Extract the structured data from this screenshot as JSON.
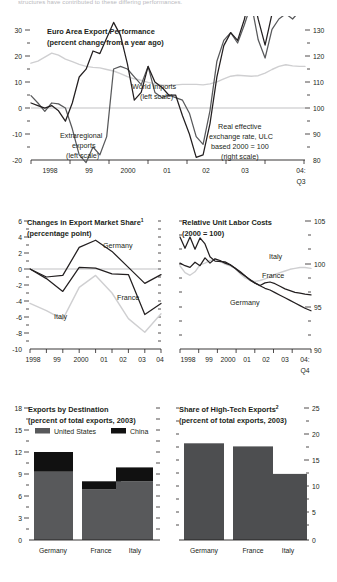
{
  "page": {
    "clipped_text_top": "structures have contributed to these differing performances."
  },
  "charts": [
    {
      "id": "export-performance",
      "type": "line",
      "title": "Euro Area Export Performance",
      "subtitle": "(percent change from a year ago)",
      "ylabel_left": "",
      "ylabel_right": "",
      "ylim_left": [
        -20,
        30
      ],
      "yticks_left": [
        "30",
        "20",
        "10",
        "0",
        "-10",
        "-20"
      ],
      "ylim_right": [
        80,
        130
      ],
      "yticks_right": [
        "130",
        "120",
        "110",
        "100",
        "90",
        "80"
      ],
      "xticks": [
        "1998",
        "99",
        "2000",
        "01",
        "02",
        "03",
        "04:"
      ],
      "xtick_sub": "Q3",
      "annotations": [
        {
          "label": "World imports",
          "label2": "(left scale)"
        },
        {
          "label": "Extraregional",
          "label2": "exports",
          "label3": "(left scale)"
        },
        {
          "label": "Real effective",
          "label2": "exchange rate, ULC",
          "label3": "based 2000 = 100",
          "label4": "(right scale)"
        }
      ],
      "series": [
        {
          "name": "World imports",
          "axis": "left",
          "color": "#231f20",
          "values": [
            2,
            1.5,
            1,
            1.5,
            -0.5,
            -2.5,
            1,
            6,
            7.5,
            11,
            10.5,
            13.5,
            16.5,
            14,
            8.5,
            1.5,
            3,
            8,
            5,
            4,
            2.5,
            2.5,
            -1.5,
            -5,
            -9.5,
            -9,
            -3,
            6,
            12,
            14.5,
            13,
            17,
            23,
            17,
            12,
            18,
            20,
            21.5,
            20.5,
            21.5,
            23.5
          ]
        },
        {
          "name": "Extraregional exports",
          "axis": "left",
          "color": "#58595b",
          "values": [
            5,
            1,
            -3.5,
            1,
            0.5,
            0,
            -4,
            -9,
            -10.5,
            -7,
            -9,
            -5.5,
            7.5,
            8,
            7.5,
            6,
            4.5,
            8,
            3,
            2,
            2.5,
            2,
            1.5,
            -1,
            -5.5,
            -7,
            -0.5,
            9,
            13,
            14.5,
            12.5,
            16,
            22,
            15,
            11.5,
            17,
            19,
            20,
            19,
            20.5,
            22
          ]
        },
        {
          "name": "Real effective exchange rate, ULC",
          "axis": "right",
          "color": "#cfcfd1",
          "values": [
            118,
            120,
            124,
            128,
            126,
            122,
            119.5,
            117,
            115,
            114,
            113.5,
            112,
            110.5,
            108,
            105,
            103,
            101.5,
            99.5,
            98,
            97,
            96.5,
            97,
            97.5,
            97.5,
            97.5,
            97,
            98,
            100,
            103,
            105.5,
            106.5,
            106,
            105.5,
            106,
            108.5,
            112,
            115,
            116.5,
            115.5,
            115,
            115
          ]
        }
      ]
    },
    {
      "id": "export-market-share",
      "type": "line",
      "title": "Changes in Export Market Share",
      "title_superscript": "1",
      "subtitle": "(percentage point)",
      "ylim": [
        -10,
        6
      ],
      "yticks": [
        "6",
        "4",
        "2",
        "0",
        "-2",
        "-4",
        "-6",
        "-8",
        "-10"
      ],
      "xticks": [
        "1998",
        "99",
        "2000",
        "01",
        "02",
        "03",
        "04"
      ],
      "series": [
        {
          "name": "Germany",
          "color": "#231f20",
          "values": [
            0,
            -1,
            -0.8,
            2.7,
            3.6,
            2.2,
            0.2,
            -1.8,
            -0.7
          ]
        },
        {
          "name": "France",
          "color": "#333333",
          "values": [
            0,
            -1.2,
            -2.8,
            0.2,
            0.1,
            -0.6,
            -0.7,
            -5.7,
            -4.3
          ]
        },
        {
          "name": "Italy",
          "color": "#cfcfd1",
          "values": [
            -4.3,
            -5.2,
            -6.3,
            -2.3,
            -0.8,
            -3.0,
            -6.2,
            -7.9,
            -5.6
          ]
        }
      ]
    },
    {
      "id": "relative-unit-labor-costs",
      "type": "line",
      "title": "Relative Unit Labor Costs",
      "subtitle": "(2000 = 100)",
      "ylim": [
        90,
        105
      ],
      "yticks": [
        "105",
        "100",
        "95",
        "90"
      ],
      "xticks": [
        "1998",
        "99",
        "2000",
        "01",
        "02",
        "03",
        "04:"
      ],
      "xtick_sub": "Q4",
      "series": [
        {
          "name": "Germany",
          "color": "#231f20",
          "values": [
            103.6,
            102.3,
            103.6,
            102.2,
            103.5,
            102.8,
            101.3,
            100.8,
            100.7,
            100.7,
            100.4,
            100,
            99.6,
            99.1,
            98.6,
            98.2,
            97.9,
            97.6,
            97.3,
            97.1,
            96.8,
            96.5,
            96.2,
            95.9,
            95.6,
            95.3,
            95.0
          ]
        },
        {
          "name": "France",
          "color": "#3a3a3c",
          "values": [
            100.6,
            100.3,
            100.1,
            100.7,
            100.3,
            101.2,
            100.6,
            101.1,
            100.9,
            100.6,
            100.4,
            100,
            99.5,
            99.1,
            98.7,
            98.3,
            98.0,
            98.3,
            98.4,
            98.2,
            97.9,
            97.6,
            97.4,
            97.2,
            97.1,
            97.0,
            96.9
          ]
        },
        {
          "name": "Italy",
          "color": "#cfcfd1",
          "values": [
            100.3,
            99.5,
            99.2,
            99.6,
            100.4,
            100.6,
            100.9,
            101.1,
            100.8,
            100.5,
            100.3,
            100,
            99.4,
            98.9,
            98.6,
            98.5,
            98.6,
            98.8,
            99.0,
            99.3,
            99.5,
            99.7,
            99.9,
            100.0,
            100.1,
            100.1,
            100.0
          ]
        }
      ]
    },
    {
      "id": "exports-by-destination",
      "type": "bar",
      "title": "Exports by Destination",
      "subtitle": "(percent of total exports, 2003)",
      "ylim": [
        0,
        18
      ],
      "yticks": [
        "18",
        "15",
        "12",
        "9",
        "6",
        "3",
        "0"
      ],
      "categories": [
        "Germany",
        "France",
        "Italy"
      ],
      "legend": [
        {
          "label": "United States",
          "color": "#58595b"
        },
        {
          "label": "China",
          "color": "#111111"
        }
      ],
      "series": [
        {
          "name": "United States",
          "color": "#58595b",
          "values": [
            9.3,
            6.9,
            8.0
          ]
        },
        {
          "name": "China",
          "color": "#111111",
          "values": [
            2.7,
            1.1,
            1.9
          ]
        }
      ]
    },
    {
      "id": "share-high-tech-exports",
      "type": "bar",
      "title": "Share of High-Tech Exports",
      "title_superscript": "2",
      "subtitle": "(percent of total exports, 2003)",
      "ylim": [
        0,
        25
      ],
      "yticks": [
        "25",
        "20",
        "15",
        "10",
        "5",
        "0"
      ],
      "categories": [
        "Germany",
        "France",
        "Italy"
      ],
      "series": [
        {
          "name": "Share of high-tech exports",
          "color": "#4d4e50",
          "values": [
            18.6,
            18.0,
            12.7
          ]
        }
      ]
    }
  ]
}
